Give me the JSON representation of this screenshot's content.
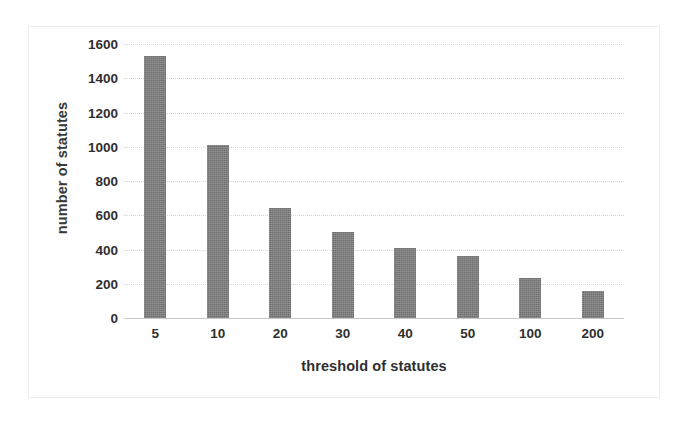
{
  "chart_data": {
    "type": "bar",
    "title": "",
    "xlabel": "threshold of statutes",
    "ylabel": "number of statutes",
    "categories": [
      "5",
      "10",
      "20",
      "30",
      "40",
      "50",
      "100",
      "200"
    ],
    "values": [
      1530,
      1010,
      645,
      500,
      410,
      365,
      235,
      155
    ],
    "series": [
      {
        "name": "number of statutes",
        "values": [
          1530,
          1010,
          645,
          500,
          410,
          365,
          235,
          155
        ]
      }
    ],
    "ylim": [
      0,
      1600
    ],
    "yticks": [
      0,
      200,
      400,
      600,
      800,
      1000,
      1200,
      1400,
      1600
    ],
    "ytick_labels": [
      "0",
      "200",
      "400",
      "600",
      "800",
      "1000",
      "1200",
      "1400",
      "1600"
    ],
    "grid": true,
    "legend": false,
    "legend_position": "none",
    "bar_color": "#7b7b7b",
    "background_color": "#ffffff",
    "gridline_color": "#d8d8d8",
    "axis_text_color": "#2f2f2f"
  }
}
